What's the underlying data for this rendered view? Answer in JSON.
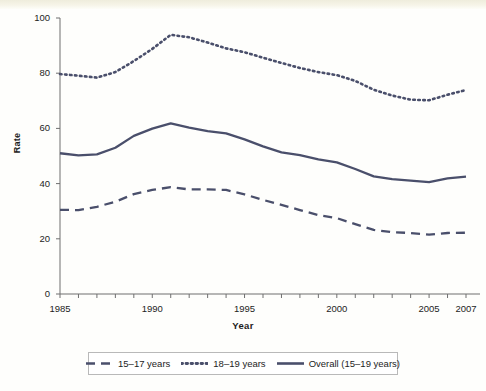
{
  "figure": {
    "background_color": "#fefefc",
    "line_color": "#4a4f6b",
    "axis_color": "#6f6f6f"
  },
  "axes": {
    "y_title": "Rate",
    "x_title": "Year",
    "y_ticks": [
      "0",
      "20",
      "40",
      "60",
      "80",
      "100"
    ],
    "x_ticks": [
      "1985",
      "1990",
      "1995",
      "2000",
      "2005",
      "2007"
    ]
  },
  "legend": {
    "items": [
      {
        "label": "15–17 years",
        "style": "dashed"
      },
      {
        "label": "18–19 years",
        "style": "dotted"
      },
      {
        "label": "Overall (15–19 years)",
        "style": "solid"
      }
    ]
  },
  "chart_data": {
    "type": "line",
    "title": "",
    "xlabel": "Year",
    "ylabel": "Rate",
    "xlim": [
      1985,
      2007
    ],
    "ylim": [
      0,
      100
    ],
    "grid": false,
    "legend_position": "bottom",
    "x": [
      1985,
      1986,
      1987,
      1988,
      1989,
      1990,
      1991,
      1992,
      1993,
      1994,
      1995,
      1996,
      1997,
      1998,
      1999,
      2000,
      2001,
      2002,
      2003,
      2004,
      2005,
      2006,
      2007
    ],
    "series": [
      {
        "name": "15–17 years",
        "style": "dashed",
        "values": [
          30.5,
          30.4,
          31.6,
          33.4,
          36.2,
          37.7,
          38.7,
          37.9,
          37.9,
          37.7,
          36.1,
          34.1,
          32.3,
          30.4,
          28.6,
          27.5,
          25.3,
          23.2,
          22.4,
          22.1,
          21.5,
          22.1,
          22.2
        ]
      },
      {
        "name": "18–19 years",
        "style": "dotted",
        "values": [
          79.7,
          79.1,
          78.4,
          80.4,
          84.4,
          88.8,
          93.9,
          93.0,
          91.1,
          89.0,
          87.6,
          85.6,
          83.7,
          81.9,
          80.4,
          79.3,
          77.2,
          74.0,
          71.9,
          70.4,
          70.2,
          72.2,
          73.9
        ]
      },
      {
        "name": "Overall (15–19 years)",
        "style": "solid",
        "values": [
          51.0,
          50.2,
          50.6,
          53.0,
          57.3,
          59.9,
          61.8,
          60.3,
          59.0,
          58.2,
          56.0,
          53.5,
          51.3,
          50.3,
          48.8,
          47.7,
          45.3,
          42.6,
          41.6,
          41.1,
          40.5,
          41.9,
          42.5
        ]
      }
    ]
  }
}
